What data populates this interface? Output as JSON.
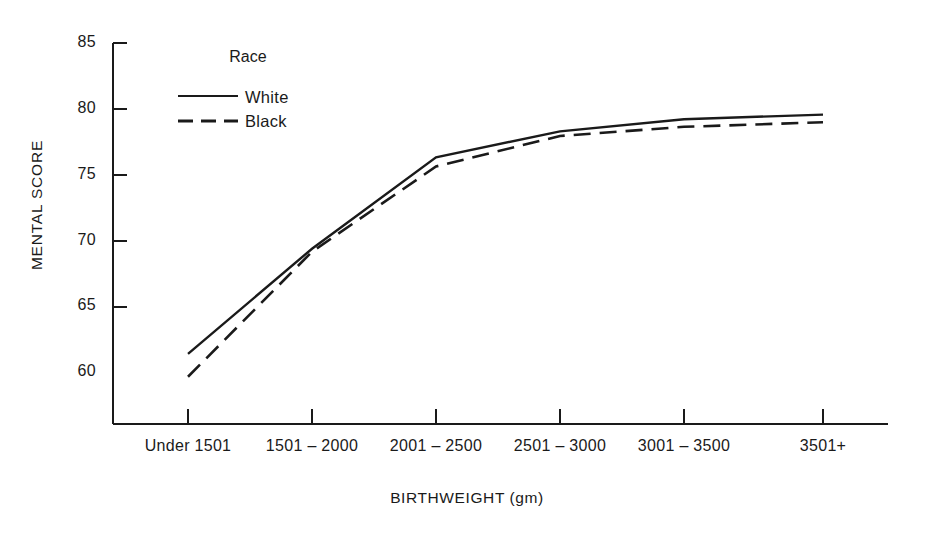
{
  "chart_data": {
    "type": "line",
    "title": "",
    "xlabel": "BIRTHWEIGHT (gm)",
    "ylabel": "MENTAL SCORE",
    "categories": [
      "Under 1501",
      "1501 – 2000",
      "2001 – 2500",
      "2501 – 3000",
      "3001 – 3500",
      "3501+"
    ],
    "ylim": [
      60,
      85
    ],
    "yticks": [
      60,
      65,
      70,
      75,
      80,
      85
    ],
    "grid": false,
    "legend": {
      "title": "Race",
      "position": "upper-left-inside",
      "entries": [
        {
          "name": "White",
          "style": "solid"
        },
        {
          "name": "Black",
          "style": "dashed"
        }
      ]
    },
    "series": [
      {
        "name": "White",
        "style": "solid",
        "values": [
          64.6,
          71.5,
          77.5,
          79.2,
          80.0,
          80.3
        ]
      },
      {
        "name": "Black",
        "style": "dashed",
        "values": [
          63.1,
          71.3,
          76.9,
          78.9,
          79.5,
          79.8
        ]
      }
    ]
  },
  "axis": {
    "y_tick_labels": [
      "85",
      "80",
      "75",
      "70",
      "65",
      "60"
    ],
    "x_tick_labels": [
      "Under 1501",
      "1501 – 2000",
      "2001 – 2500",
      "2501 – 3000",
      "3001 – 3500",
      "3501+"
    ],
    "y_title": "MENTAL SCORE",
    "x_title": "BIRTHWEIGHT (gm)"
  },
  "legend": {
    "title": "Race",
    "white_label": "White",
    "black_label": "Black"
  },
  "colors": {
    "line": "#1a1a1a",
    "axis": "#1a1a1a",
    "background": "#ffffff"
  }
}
